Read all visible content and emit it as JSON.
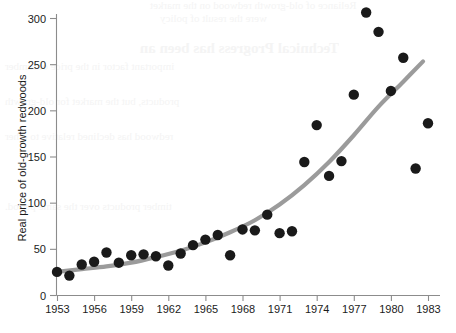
{
  "figure": {
    "background_color": "#ffffff",
    "width": 456,
    "height": 333
  },
  "bleed_through_text": {
    "color": "#f4f4f4",
    "lines": [
      "Reliance of old-growth redwood on the market",
      "were the result of policy",
      "Technical Progress has been an",
      "important factor in the price of lumber",
      "products, but the market for old-growth",
      "redwood has declined relative to other",
      "timber products over the same period."
    ]
  },
  "chart_data": {
    "type": "scatter",
    "title": "",
    "xlabel": "",
    "ylabel": "Real price of old-growth redwoods",
    "xlim": [
      1953,
      1984
    ],
    "ylim": [
      0,
      312
    ],
    "grid": false,
    "legend": "none",
    "xticks": [
      1953,
      1956,
      1959,
      1962,
      1965,
      1968,
      1971,
      1974,
      1977,
      1980,
      1983
    ],
    "xtick_labels": [
      "1953",
      "1956",
      "1959",
      "1962",
      "1965",
      "1968",
      "1971",
      "1974",
      "1977",
      "1980",
      "1983"
    ],
    "yticks": [
      0,
      50,
      100,
      150,
      200,
      250,
      300
    ],
    "ytick_labels": [
      "0",
      "50",
      "100",
      "150",
      "200",
      "250",
      "300"
    ],
    "marker_color": "#1a1a1a",
    "marker_size": 5.2,
    "points": [
      {
        "x": 1953,
        "y": 25
      },
      {
        "x": 1954,
        "y": 21
      },
      {
        "x": 1955,
        "y": 33
      },
      {
        "x": 1956,
        "y": 36
      },
      {
        "x": 1957,
        "y": 46
      },
      {
        "x": 1958,
        "y": 35
      },
      {
        "x": 1959,
        "y": 43
      },
      {
        "x": 1960,
        "y": 44
      },
      {
        "x": 1961,
        "y": 42
      },
      {
        "x": 1962,
        "y": 32
      },
      {
        "x": 1963,
        "y": 45
      },
      {
        "x": 1964,
        "y": 54
      },
      {
        "x": 1965,
        "y": 60
      },
      {
        "x": 1966,
        "y": 65
      },
      {
        "x": 1967,
        "y": 43
      },
      {
        "x": 1968,
        "y": 71
      },
      {
        "x": 1969,
        "y": 70
      },
      {
        "x": 1970,
        "y": 87
      },
      {
        "x": 1971,
        "y": 67
      },
      {
        "x": 1972,
        "y": 69
      },
      {
        "x": 1973,
        "y": 144
      },
      {
        "x": 1974,
        "y": 184
      },
      {
        "x": 1975,
        "y": 129
      },
      {
        "x": 1976,
        "y": 145
      },
      {
        "x": 1977,
        "y": 217
      },
      {
        "x": 1978,
        "y": 306
      },
      {
        "x": 1979,
        "y": 285
      },
      {
        "x": 1980,
        "y": 221
      },
      {
        "x": 1981,
        "y": 257
      },
      {
        "x": 1982,
        "y": 137
      },
      {
        "x": 1983,
        "y": 186
      }
    ],
    "fit_curve": {
      "name": "exponential-trend",
      "color": "#9b9b9b",
      "width": 4.2,
      "points": [
        {
          "x": 1953,
          "y": 25
        },
        {
          "x": 1955,
          "y": 28
        },
        {
          "x": 1957,
          "y": 31
        },
        {
          "x": 1959,
          "y": 35
        },
        {
          "x": 1961,
          "y": 41
        },
        {
          "x": 1963,
          "y": 48
        },
        {
          "x": 1965,
          "y": 57
        },
        {
          "x": 1967,
          "y": 68
        },
        {
          "x": 1969,
          "y": 81
        },
        {
          "x": 1971,
          "y": 98
        },
        {
          "x": 1973,
          "y": 119
        },
        {
          "x": 1975,
          "y": 144
        },
        {
          "x": 1977,
          "y": 173
        },
        {
          "x": 1979,
          "y": 204
        },
        {
          "x": 1981,
          "y": 231
        },
        {
          "x": 1982.6,
          "y": 253
        }
      ]
    }
  }
}
